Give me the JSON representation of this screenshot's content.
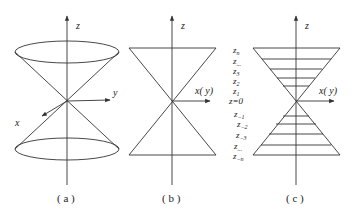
{
  "panels": [
    {
      "id": "a",
      "caption": "( a )",
      "axes": {
        "z": "z",
        "y": "y",
        "x": "x"
      }
    },
    {
      "id": "b",
      "caption": "( b )",
      "axes": {
        "z": "z",
        "horizontal": "x( y)"
      }
    },
    {
      "id": "c",
      "caption": "( c )",
      "axes": {
        "z": "z",
        "horizontal": "x( y)"
      },
      "levels": {
        "zn": "z",
        "zn_sub": "n",
        "zdots_top": "z",
        "zdots_top_sub": "...",
        "z3": "z",
        "z3_sub": "3",
        "z2": "z",
        "z2_sub": "2",
        "z1": "z",
        "z1_sub": "1",
        "z0": "z=0",
        "zm1": "z",
        "zm1_sub": "−1",
        "zm2": "z",
        "zm2_sub": "−2",
        "zm3": "z",
        "zm3_sub": "−3",
        "zdots_bot": "z",
        "zdots_bot_sub": "...",
        "zmn": "z",
        "zmn_sub": "−n"
      }
    }
  ],
  "colors": {
    "stroke": "#333333",
    "background": "#ffffff"
  }
}
